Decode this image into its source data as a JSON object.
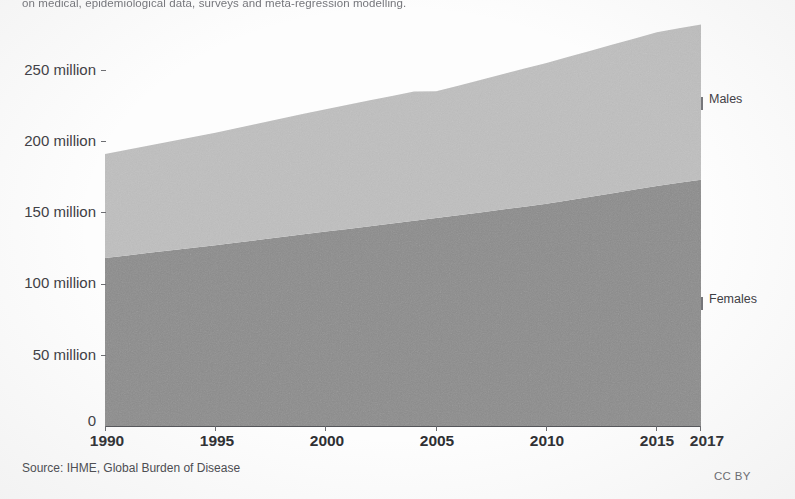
{
  "caption": {
    "top_line": "on medical, epidemiological data, surveys and meta-regression modelling."
  },
  "footer": {
    "source": "Source: IHME, Global Burden of Disease",
    "license": "CC BY"
  },
  "axes": {
    "y_ticks": [
      "250 million",
      "200 million",
      "150 million",
      "100 million",
      "50 million",
      "0"
    ],
    "x_ticks": [
      "1990",
      "1995",
      "2000",
      "2005",
      "2010",
      "2015",
      "2017"
    ]
  },
  "series_labels": {
    "males": "Males",
    "females": "Females"
  },
  "colors": {
    "males": "#c0c0c0",
    "females": "#8d8d8d",
    "axis": "#55565a",
    "text": "#3f4045",
    "background": "#fefefe"
  },
  "chart_data": {
    "type": "area",
    "stacked": true,
    "title": "",
    "subtitle": "",
    "xlabel": "",
    "ylabel": "",
    "grid": false,
    "legend_position": "right-direct-labels",
    "xlim": [
      1990,
      2017
    ],
    "ylim": [
      0,
      282
    ],
    "y_tick_values": [
      250,
      200,
      150,
      100,
      50,
      0
    ],
    "y_tick_labels": [
      "250 million",
      "200 million",
      "150 million",
      "100 million",
      "50 million",
      "0"
    ],
    "x_tick_values": [
      1990,
      1995,
      2000,
      2005,
      2010,
      2015,
      2017
    ],
    "x_tick_labels": [
      "1990",
      "1995",
      "2000",
      "2005",
      "2010",
      "2015",
      "2017"
    ],
    "units": "people (millions)",
    "x": [
      1990,
      1991,
      1992,
      1993,
      1994,
      1995,
      1996,
      1997,
      1998,
      1999,
      2000,
      2001,
      2002,
      2003,
      2004,
      2005,
      2006,
      2007,
      2008,
      2009,
      2010,
      2011,
      2012,
      2013,
      2014,
      2015,
      2016,
      2017
    ],
    "series": [
      {
        "name": "Females",
        "color": "#8d8d8d",
        "stack_order": 1,
        "values": [
          118,
          119.8,
          121.6,
          123.4,
          125.2,
          127,
          128.9,
          130.8,
          132.7,
          134.6,
          136.5,
          138.4,
          140.3,
          142.2,
          144.1,
          146,
          148,
          150,
          152,
          154,
          156,
          158.5,
          161,
          163.5,
          166,
          168.5,
          170.8,
          173
        ]
      },
      {
        "name": "Males",
        "color": "#c0c0c0",
        "stack_order": 2,
        "values": [
          73,
          74.2,
          75.4,
          76.6,
          77.8,
          79,
          80.4,
          81.8,
          83.2,
          84.6,
          86,
          87.2,
          88.4,
          89.6,
          90.8,
          89,
          91,
          93,
          95,
          97,
          99,
          100.8,
          102.6,
          104.4,
          106.2,
          108,
          108.5,
          109
        ]
      }
    ],
    "totals": [
      191,
      194,
      197,
      200,
      203,
      206,
      209.3,
      212.6,
      215.9,
      219.2,
      222.5,
      225.6,
      228.7,
      231.8,
      234.9,
      235,
      239,
      243,
      247,
      251,
      255,
      259.3,
      263.6,
      267.9,
      272.2,
      276.5,
      279.3,
      282
    ],
    "annotations": [
      {
        "text": "Males",
        "at_x": 2017,
        "at_y": 227
      },
      {
        "text": "Females",
        "at_x": 2017,
        "at_y": 87
      }
    ]
  }
}
